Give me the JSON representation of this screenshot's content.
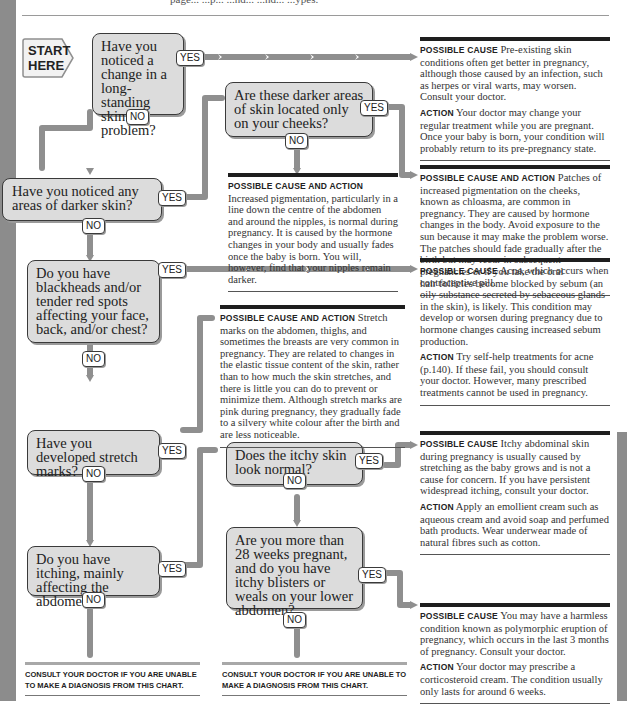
{
  "header": {
    "cut_text": "page... ...p... ...nd... ...nd... ...ypes."
  },
  "start": {
    "label_line1": "START",
    "label_line2": "HERE"
  },
  "questions": [
    {
      "id": "q1",
      "text": "Have you noticed a change in a long-standing skin problem?",
      "yes": "YES",
      "no": "NO"
    },
    {
      "id": "q2",
      "text": "Are these darker areas of skin located only on your cheeks?",
      "yes": "YES",
      "no": "NO"
    },
    {
      "id": "q3",
      "text": "Have you noticed any areas of darker skin?",
      "yes": "YES",
      "no": "NO"
    },
    {
      "id": "q4",
      "text": "Do you have blackheads and/or tender red spots affecting your face, back, and/or chest?",
      "yes": "YES",
      "no": "NO"
    },
    {
      "id": "q5",
      "text": "Have you developed stretch marks?",
      "yes": "YES",
      "no": "NO"
    },
    {
      "id": "q6",
      "text": "Does the itchy skin look normal?",
      "yes": "YES",
      "no": "NO"
    },
    {
      "id": "q7",
      "text": "Do you have itching, mainly affecting the abdomen?",
      "yes": "YES",
      "no": "NO"
    },
    {
      "id": "q8",
      "text": "Are you more than 28 weeks pregnant, and do you have itchy blisters or weals on your lower abdomen?",
      "yes": "YES",
      "no": "NO"
    }
  ],
  "results": [
    {
      "id": "r1",
      "h1": "Possible cause",
      "t1": "Pre-existing skin conditions often get better in pregnancy, although those caused by an infection, such as herpes or viral warts, may worsen. Consult your doctor.",
      "h2": "Action",
      "t2": "Your doctor may change your regular treatment while you are pregnant. Once your baby is born, your condition will probably return to its pre-pregnancy state."
    },
    {
      "id": "r2",
      "h1": "Possible cause and action",
      "t1": "Increased pigmentation, particularly in a line down the centre of the abdomen and around the nipples, is normal during pregnancy. It is caused by the hormone changes in your body and usually fades once the baby is born. You will, however, find that your nipples remain darker."
    },
    {
      "id": "r3",
      "h1": "Possible cause and action",
      "t1": "Patches of increased pigmentation on the cheeks, known as chloasma, are common in pregnancy. They are caused by hormone changes in the body. Avoid exposure to the sun because it may make the problem worse. The patches should fade gradually after the birth but may recur in subsequent pregnancies or if you take the oral contraceptive pill."
    },
    {
      "id": "r4",
      "h1": "Possible cause",
      "t1": "Acne, which occurs when hair follicles become blocked by sebum (an oily substance secreted by sebaceous glands in the skin), is likely. This condition may develop or worsen during pregnancy due to hormone changes causing increased sebum production.",
      "h2": "Action",
      "t2": "Try self-help treatments for acne (p.140). If these fail, you should consult your doctor. However, many prescribed treatments cannot be used in pregnancy."
    },
    {
      "id": "r5",
      "h1": "Possible cause and action",
      "t1": "Stretch marks on the abdomen, thighs, and sometimes the breasts are very common in pregnancy. They are related to changes in the elastic tissue content of the skin, rather than to how much the skin stretches, and there is little you can do to prevent or minimize them. Although stretch marks are pink during pregnancy, they gradually fade to a silvery white colour after the birth and are less noticeable."
    },
    {
      "id": "r6",
      "h1": "Possible cause",
      "t1": "Itchy abdominal skin during pregnancy is usually caused by stretching as the baby grows and is not a cause for concern. If you have persistent widespread itching, consult your doctor.",
      "h2": "Action",
      "t2": "Apply an emollient cream such as aqueous cream and avoid soap and perfumed bath products. Wear underwear made of natural fibres such as cotton."
    },
    {
      "id": "r7",
      "h1": "Possible cause",
      "t1": "You may have a harmless condition known as polymorphic eruption of pregnancy, which occurs in the last 3 months of pregnancy. Consult your doctor.",
      "h2": "Action",
      "t2": "Your doctor may prescribe a corticosteroid cream. The condition usually only lasts for around 6 weeks."
    }
  ],
  "consult": [
    {
      "text": "Consult your doctor if you are unable to make a diagnosis from this chart."
    },
    {
      "text": "Consult your doctor if you are unable to make a diagnosis from this chart."
    }
  ],
  "colors": {
    "box_fill": "#dcdcdc",
    "connector": "#8f8f8f",
    "side_band": "#8c8c8c",
    "rule": "#1e1e1e"
  }
}
